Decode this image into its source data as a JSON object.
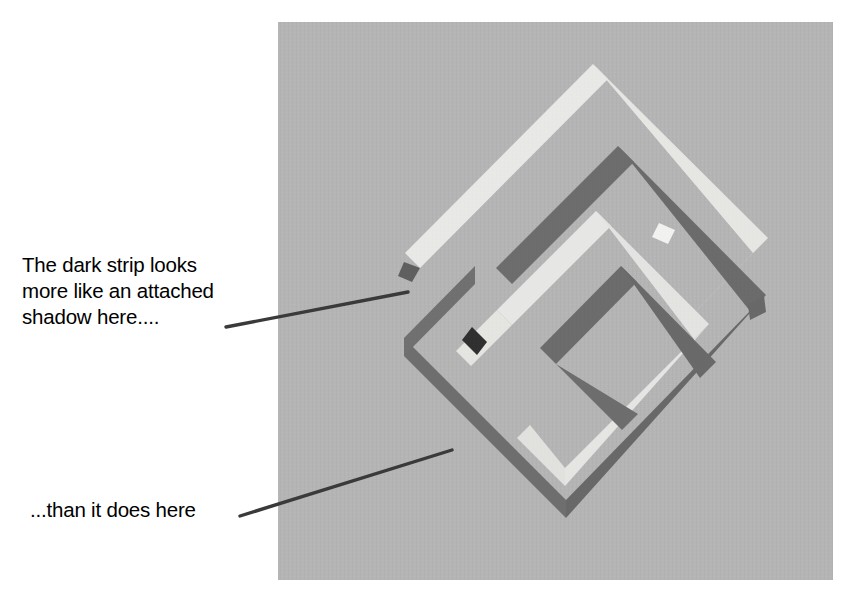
{
  "figure": {
    "kind": "illusion-diagram",
    "title_visible": false,
    "panel": {
      "name": "illusion-image-panel",
      "x": 278,
      "y": 22,
      "width": 555,
      "height": 558,
      "background_color": "#b4b4b4",
      "texture": "fine woven canvas grain"
    },
    "colors": {
      "background": "#b4b4b4",
      "light_strip": "#f1f1ef",
      "light_strip_shade": "#e3e3e0",
      "dark_strip": "#5c5c5c",
      "dark_strip_shade": "#6e6e6e",
      "dark_overlap": "#171717",
      "leader_line": "#3a3a3a",
      "text": "#000000"
    },
    "shapes": [
      {
        "name": "outer-light-ribbon",
        "tone": "light",
        "description": "large diamond-shaped ribbon outline, bright white, upper-left to lower-right"
      },
      {
        "name": "outer-dark-ribbon",
        "tone": "dark",
        "description": "large diamond-shaped ribbon outline, dark gray, offset below-right of the light ribbon"
      },
      {
        "name": "inner-light-ribbon",
        "tone": "light",
        "description": "smaller concentric diamond ribbon, bright white"
      },
      {
        "name": "inner-dark-ribbon",
        "tone": "dark",
        "description": "smaller concentric diamond ribbon, dark gray"
      },
      {
        "name": "dark-overlap-patch",
        "tone": "very-dark",
        "description": "near-black rhombus where two dark strips cross, left of center"
      }
    ]
  },
  "annotations": {
    "top": {
      "name": "annotation-attached-shadow",
      "text": "The dark strip looks\nmore like an attached\nshadow here....",
      "leader": {
        "x1": 226,
        "y1": 327,
        "x2": 408,
        "y2": 292
      }
    },
    "bottom": {
      "name": "annotation-than-it-does-here",
      "text": "...than it does here",
      "leader": {
        "x1": 240,
        "y1": 516,
        "x2": 452,
        "y2": 450
      }
    }
  }
}
